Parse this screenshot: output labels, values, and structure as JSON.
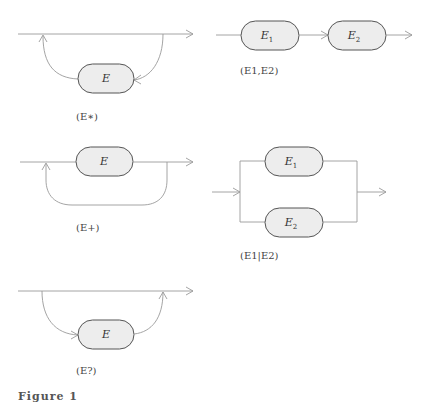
{
  "diagrams": [
    {
      "id": "star",
      "node_label": "E",
      "caption": "(E∗)"
    },
    {
      "id": "sequence",
      "nodes": [
        {
          "label": "E",
          "sub": "1"
        },
        {
          "label": "E",
          "sub": "2"
        }
      ],
      "caption": "(E1,E2)"
    },
    {
      "id": "plus",
      "node_label": "E",
      "caption": "(E+)"
    },
    {
      "id": "choice",
      "nodes": [
        {
          "label": "E",
          "sub": "1"
        },
        {
          "label": "E",
          "sub": "2"
        }
      ],
      "caption": "(E1|E2)"
    },
    {
      "id": "optional",
      "node_label": "E",
      "caption": "(E?)"
    }
  ],
  "figure_caption": "Figure 1"
}
